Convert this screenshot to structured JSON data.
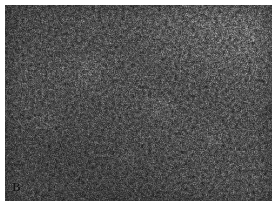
{
  "figure": {
    "kind": "photomicrograph",
    "modality": "light-microscopy",
    "staining": "hematoxylin-and-eosin",
    "rendering": "grayscale",
    "caption_visible": false
  },
  "panel": {
    "label": "B",
    "label_position": "bottom-left",
    "label_color": "#141414",
    "label_style": "bold-serif"
  },
  "plate": {
    "width_px": 267,
    "height_px": 196,
    "margin_top_px": 5,
    "margin_left_px": 5,
    "margin_right_px": 6,
    "margin_bottom_px": 1,
    "page_background": "#ffffff",
    "border": "none"
  },
  "appearance": {
    "base_gray": "#8a8a8a",
    "dark_gray": "#2e2e2e",
    "light_gray": "#e6e6e6",
    "texture": "dense fine nuclear speckle",
    "tonal_notes": [
      "brighter washed band across upper-right quadrant",
      "darker tone toward lower-left and bottom-center",
      "faint pale nodular lobules scattered mid-field"
    ]
  },
  "annotations": {
    "scale_bar": null,
    "arrows": [],
    "text_overlays": []
  }
}
